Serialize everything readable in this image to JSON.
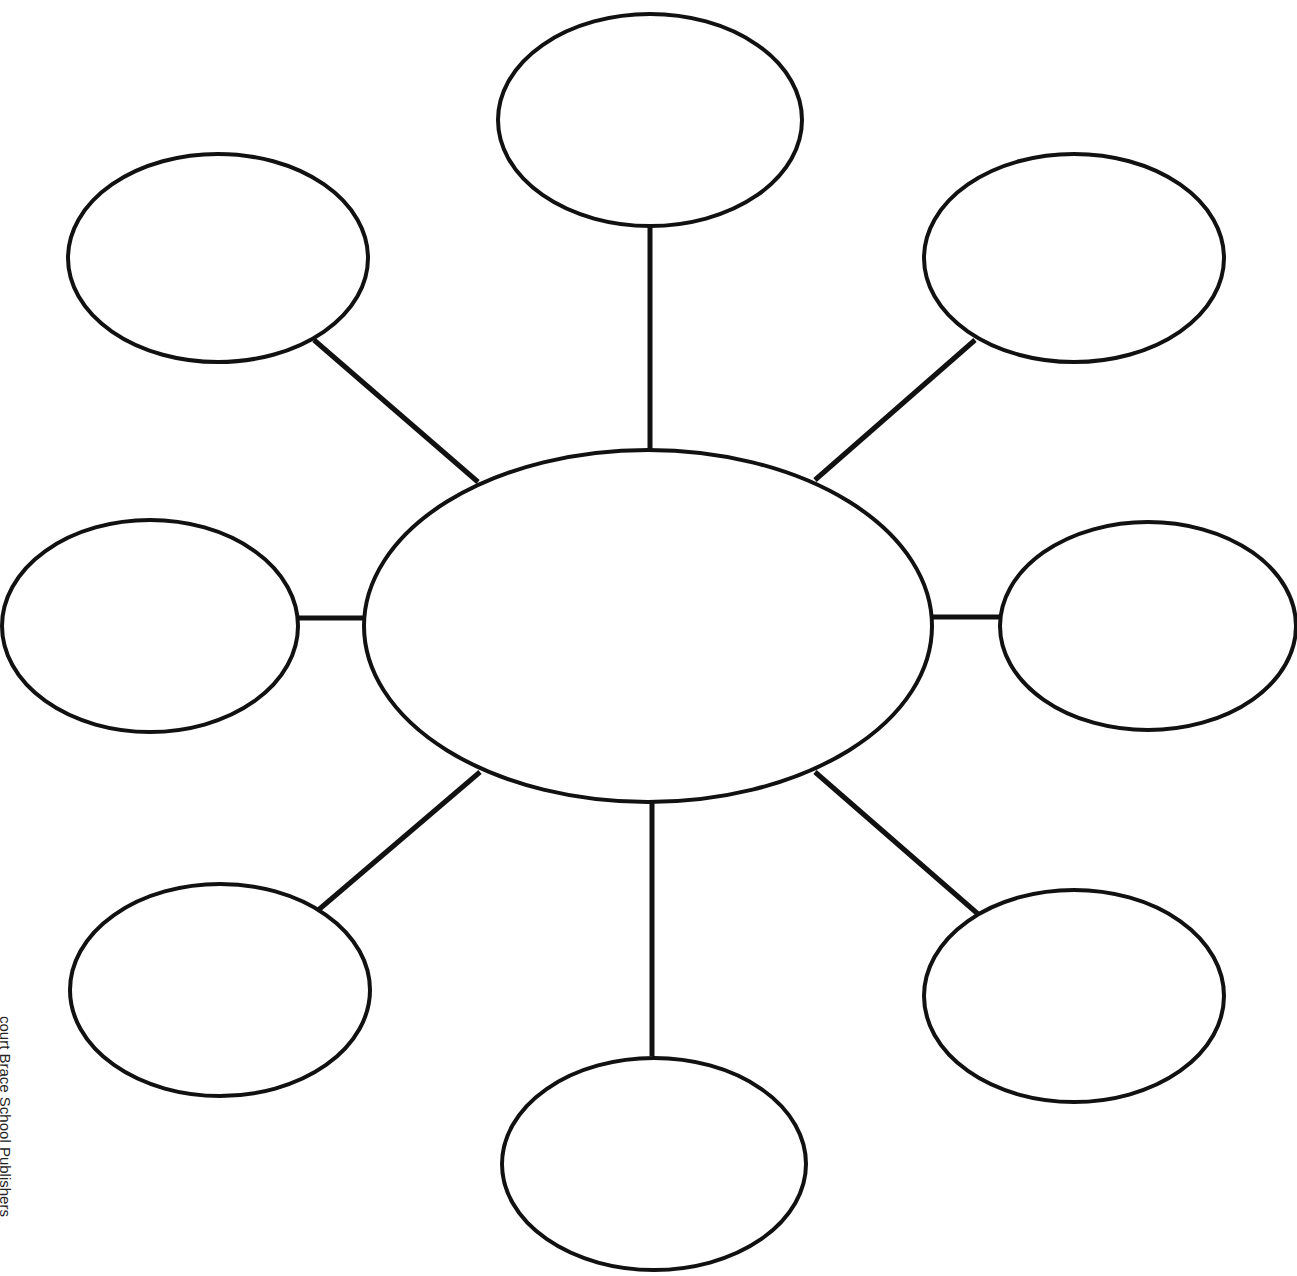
{
  "diagram": {
    "type": "bubble-map",
    "stroke_color": "#111111",
    "stroke_width": 4,
    "background": "#ffffff",
    "center": {
      "name": "center-bubble",
      "cx": 648,
      "cy": 626,
      "rx": 284,
      "ry": 176,
      "label": ""
    },
    "outer": [
      {
        "name": "bubble-top",
        "cx": 650,
        "cy": 120,
        "rx": 152,
        "ry": 106,
        "label": "",
        "line": [
          650,
          227,
          650,
          450
        ]
      },
      {
        "name": "bubble-top-right",
        "cx": 1074,
        "cy": 258,
        "rx": 150,
        "ry": 104,
        "label": "",
        "line": [
          975,
          340,
          815,
          480
        ]
      },
      {
        "name": "bubble-right",
        "cx": 1148,
        "cy": 626,
        "rx": 148,
        "ry": 104,
        "label": "",
        "line": [
          1000,
          617,
          932,
          617
        ]
      },
      {
        "name": "bubble-bottom-right",
        "cx": 1074,
        "cy": 996,
        "rx": 150,
        "ry": 106,
        "label": "",
        "line": [
          978,
          914,
          815,
          772
        ]
      },
      {
        "name": "bubble-bottom",
        "cx": 654,
        "cy": 1164,
        "rx": 152,
        "ry": 106,
        "label": "",
        "line": [
          652,
          1056,
          652,
          802
        ]
      },
      {
        "name": "bubble-bottom-left",
        "cx": 220,
        "cy": 990,
        "rx": 150,
        "ry": 106,
        "label": "",
        "line": [
          316,
          912,
          480,
          772
        ]
      },
      {
        "name": "bubble-left",
        "cx": 150,
        "cy": 626,
        "rx": 148,
        "ry": 106,
        "label": "",
        "line": [
          298,
          618,
          366,
          618
        ]
      },
      {
        "name": "bubble-top-left",
        "cx": 218,
        "cy": 258,
        "rx": 150,
        "ry": 104,
        "label": "",
        "line": [
          314,
          340,
          478,
          482
        ]
      }
    ]
  },
  "credit_text": "court Brace School Publishers"
}
